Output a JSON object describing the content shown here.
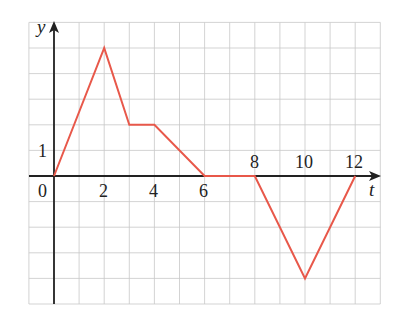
{
  "chart_data": {
    "type": "line",
    "title": "",
    "xlabel": "t",
    "ylabel": "y",
    "x": [
      0,
      2,
      3,
      4,
      6,
      8,
      10,
      12
    ],
    "series": [
      {
        "name": "y(t)",
        "values": [
          0,
          5,
          2,
          2,
          0,
          0,
          -4,
          0
        ],
        "color": "#e8584a"
      }
    ],
    "xlim": [
      -1,
      13
    ],
    "ylim": [
      -5,
      6
    ],
    "grid": true,
    "x_tick_labels": [
      "0",
      "2",
      "4",
      "6",
      "8",
      "10",
      "12"
    ],
    "y_tick_labels": [
      "1"
    ],
    "legend": null
  },
  "labels": {
    "origin": "0",
    "x2": "2",
    "x4": "4",
    "x6": "6",
    "x8": "8",
    "x10": "10",
    "x12": "12",
    "y1": "1",
    "xaxis": "t",
    "yaxis": "y"
  }
}
